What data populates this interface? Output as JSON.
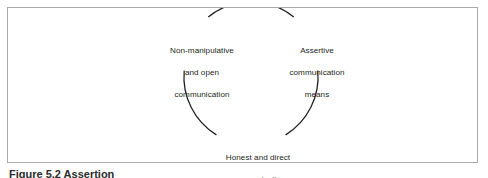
{
  "figure": {
    "frame_border_color": "#a9a9a9",
    "background_color": "#ffffff",
    "arc_color": "#1f1f1f",
    "text_color": "#231f20",
    "caption_fragment": "Figure 5.2  Assertion"
  },
  "diagram": {
    "type": "cycle",
    "node_count": 3,
    "nodes": [
      {
        "position": "left",
        "lines": [
          "Non-manipulative",
          "and open",
          "communication"
        ]
      },
      {
        "position": "right",
        "lines": [
          "Assertive",
          "communication",
          "means"
        ]
      },
      {
        "position": "bottom",
        "lines": [
          "Honest and direct",
          "communication"
        ]
      }
    ],
    "arcs": [
      {
        "name": "top-arc",
        "from_node": "left",
        "to_node": "right"
      },
      {
        "name": "left-arc",
        "from_node": "left",
        "to_node": "bottom"
      },
      {
        "name": "right-arc",
        "from_node": "right",
        "to_node": "bottom"
      }
    ]
  }
}
